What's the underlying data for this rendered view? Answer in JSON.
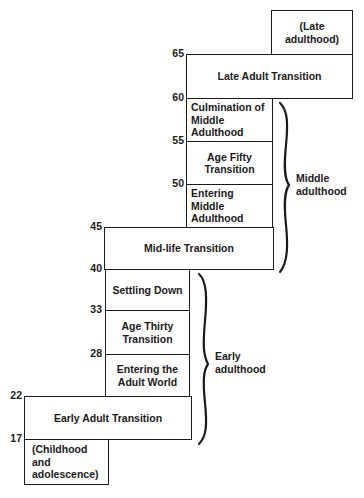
{
  "diagram": {
    "type": "staircase developmental periods",
    "stages": [
      {
        "id": "late-adulthood",
        "label": "(Late adulthood)",
        "start_age": 65,
        "end_age": null
      },
      {
        "id": "late-adult-transition",
        "label": "Late Adult Transition",
        "start_age": 60,
        "end_age": 65
      },
      {
        "id": "culmination-middle-adulthood",
        "label": "Culmination of\nMiddle Adulthood",
        "start_age": 55,
        "end_age": 60
      },
      {
        "id": "age-fifty-transition",
        "label": "Age Fifty\nTransition",
        "start_age": 50,
        "end_age": 55
      },
      {
        "id": "entering-middle-adulthood",
        "label": "Entering\nMiddle Adulthood",
        "start_age": 45,
        "end_age": 50
      },
      {
        "id": "mid-life-transition",
        "label": "Mid-life Transition",
        "start_age": 40,
        "end_age": 45
      },
      {
        "id": "settling-down",
        "label": "Settling Down",
        "start_age": 33,
        "end_age": 40
      },
      {
        "id": "age-thirty-transition",
        "label": "Age Thirty\nTransition",
        "start_age": 28,
        "end_age": 33
      },
      {
        "id": "entering-adult-world",
        "label": "Entering the\nAdult World",
        "start_age": 22,
        "end_age": 28
      },
      {
        "id": "early-adult-transition",
        "label": "Early Adult Transition",
        "start_age": 17,
        "end_age": 22
      },
      {
        "id": "childhood-adolescence",
        "label": "(Childhood and\nadolescence)",
        "start_age": null,
        "end_age": 17
      }
    ],
    "ages": [
      "65",
      "60",
      "55",
      "50",
      "45",
      "40",
      "33",
      "28",
      "22",
      "17"
    ],
    "eras": [
      {
        "id": "middle-adulthood",
        "label": "Middle\nadulthood"
      },
      {
        "id": "early-adulthood",
        "label": "Early\nadulthood"
      }
    ]
  }
}
